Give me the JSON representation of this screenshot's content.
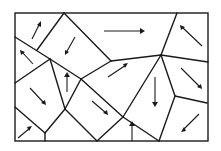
{
  "diagram": {
    "type": "polygonal-cell-partition-with-vector-arrows",
    "cell_count": 12,
    "colors": {
      "line": "#1a1a1a",
      "background": "#ffffff"
    },
    "arrows": [
      {
        "cell": "top-left-upper",
        "direction": "up-right"
      },
      {
        "cell": "top-left-lower",
        "direction": "up-left"
      },
      {
        "cell": "top-center-left",
        "direction": "down-left"
      },
      {
        "cell": "top-center-right",
        "direction": "right"
      },
      {
        "cell": "top-right",
        "direction": "up-left"
      },
      {
        "cell": "middle-narrow",
        "direction": "up"
      },
      {
        "cell": "middle-center",
        "direction": "up-right"
      },
      {
        "cell": "middle-right",
        "direction": "down-right"
      },
      {
        "cell": "left-middle",
        "direction": "down-right"
      },
      {
        "cell": "bottom-left-corner",
        "direction": "up-right"
      },
      {
        "cell": "bottom-center-left",
        "direction": "down-right"
      },
      {
        "cell": "bottom-center",
        "direction": "up"
      },
      {
        "cell": "center-right",
        "direction": "down"
      },
      {
        "cell": "bottom-right",
        "direction": "down-left"
      }
    ]
  }
}
